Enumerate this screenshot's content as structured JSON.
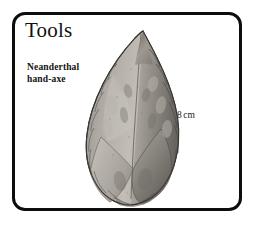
{
  "panel": {
    "title": "Tools",
    "border_color": "#0d0d0d",
    "background_color": "#ffffff"
  },
  "specimen": {
    "label_line1": "Neanderthal",
    "label_line2": "hand-axe",
    "scale_value": "8",
    "scale_unit": "cm",
    "artifact_name": "neanderthal-hand-axe-photo",
    "artifact_description": "Grey stone teardrop-shaped hand-axe with chipped flaked edges, pointed tip upward",
    "artifact_colors": {
      "highlight": "#cfcbc4",
      "light": "#b4b0a9",
      "mid": "#938f88",
      "shadow": "#6e6a64",
      "deep_shadow": "#4e4a45",
      "outline": "#3a3733"
    }
  }
}
